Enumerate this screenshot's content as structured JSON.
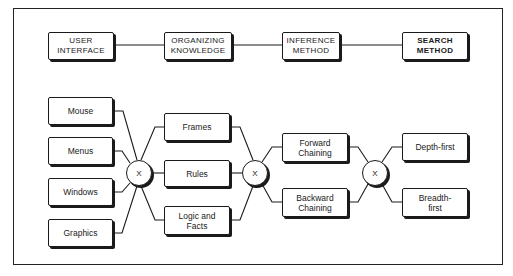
{
  "diagram": {
    "type": "morphological-composition-diagram",
    "header_row": [
      {
        "id": "user_interface",
        "label": "USER\nINTERFACE",
        "line1": "USER",
        "line2": "INTERFACE"
      },
      {
        "id": "organizing_knowledge",
        "label": "ORGANIZING KNOWLEDGE",
        "line1": "ORGANIZING",
        "line2": "KNOWLEDGE"
      },
      {
        "id": "inference_method",
        "label": "INFERENCE METHOD",
        "line1": "INFERENCE",
        "line2": "METHOD"
      },
      {
        "id": "search_method",
        "label": "SEARCH METHOD",
        "line1": "SEARCH",
        "line2": "METHOD"
      }
    ],
    "columns": {
      "user_interface": [
        {
          "line1": "Mouse",
          "line2": ""
        },
        {
          "line1": "Menus",
          "line2": ""
        },
        {
          "line1": "Windows",
          "line2": ""
        },
        {
          "line1": "Graphics",
          "line2": ""
        }
      ],
      "organizing_knowledge": [
        {
          "line1": "Frames",
          "line2": ""
        },
        {
          "line1": "Rules",
          "line2": ""
        },
        {
          "line1": "Logic and",
          "line2": "Facts"
        }
      ],
      "inference_method": [
        {
          "line1": "Forward",
          "line2": "Chaining"
        },
        {
          "line1": "Backward",
          "line2": "Chaining"
        }
      ],
      "search_method": [
        {
          "line1": "Depth-first",
          "line2": ""
        },
        {
          "line1": "Breadth-",
          "line2": "first"
        }
      ]
    },
    "junctions": [
      {
        "label": "X"
      },
      {
        "label": "X"
      },
      {
        "label": "X"
      }
    ],
    "colors": {
      "ink": "#1a1a1a",
      "background": "#ffffff"
    }
  }
}
